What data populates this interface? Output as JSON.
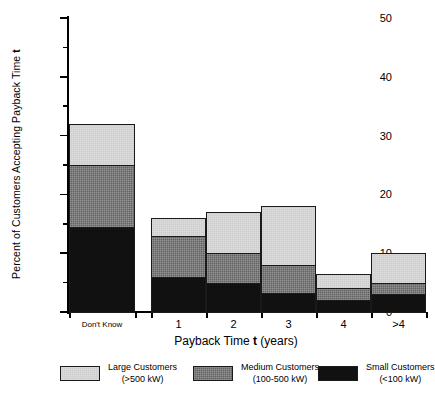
{
  "chart_data": {
    "type": "bar",
    "subtype": "stacked-bar",
    "title": "",
    "xlabel": "Payback Time t (years)",
    "ylabel": "Percent of Customers Accepting Payback Time t",
    "categories": [
      "Don't Know",
      "1",
      "2",
      "3",
      "4",
      ">4"
    ],
    "series": [
      {
        "name": "Small Customers (<100 kW)",
        "short_name": "Small Customers",
        "detail": "(<100 kW)",
        "color": "#111111",
        "values": [
          14.5,
          6,
          5,
          3.2,
          2,
          3
        ]
      },
      {
        "name": "Medium Customers (100-500 kW)",
        "short_name": "Medium Customers",
        "detail": "(100-500 kW)",
        "color": "#636363",
        "values": [
          10.5,
          7,
          5,
          4.8,
          2,
          2
        ]
      },
      {
        "name": "Large Customers (>500 kW)",
        "short_name": "Large Customers",
        "detail": "(>500 kW)",
        "color": "#cdcdcd",
        "values": [
          7,
          3,
          7,
          10,
          2.5,
          5
        ]
      }
    ],
    "totals": [
      32,
      16,
      17,
      18,
      6.5,
      10
    ],
    "ylim": [
      0,
      50
    ],
    "ymajor_ticks": [
      0,
      10,
      20,
      30,
      40,
      50
    ],
    "yminor_ticks": [
      5,
      15,
      25,
      35,
      45
    ],
    "ytick_labels": [
      "0",
      "10",
      "20",
      "30",
      "40",
      "50"
    ],
    "grid": false,
    "legend_position": "bottom",
    "stack_order": "small-medium-large"
  },
  "axis": {
    "y_title_main": "Percent of Customers Accepting Payback Time",
    "y_title_symbol": "t",
    "x_title_main": "Payback Time",
    "x_title_symbol": "t",
    "x_title_unit": "(years)"
  },
  "legend": {
    "items": [
      {
        "label": "Large Customers",
        "detail": "(>500 kW)",
        "color": "#cdcdcd"
      },
      {
        "label": "Medium Customers",
        "detail": "(100-500 kW)",
        "color": "#636363"
      },
      {
        "label": "Small Customers",
        "detail": "(<100 kW)",
        "color": "#111111"
      }
    ]
  }
}
